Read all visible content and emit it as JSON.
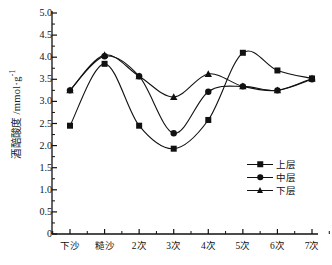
{
  "chart_data": {
    "type": "line",
    "title": "",
    "xlabel": "",
    "ylabel": "酒醅酸度 /mmol·g",
    "ylabel_exponent": "-1",
    "categories": [
      "下沙",
      "糙沙",
      "2次",
      "3次",
      "4次",
      "5次",
      "6次",
      "7次"
    ],
    "ylim": [
      0,
      5.0
    ],
    "ytick_labels": [
      "0",
      "0.5",
      "1.0",
      "1.5",
      "2.0",
      "2.5",
      "3.0",
      "3.5",
      "4.0",
      "4.5",
      "5.0"
    ],
    "ytick_values": [
      0,
      0.5,
      1.0,
      1.5,
      2.0,
      2.5,
      3.0,
      3.5,
      4.0,
      4.5,
      5.0
    ],
    "grid": false,
    "legend_position": "lower-right",
    "series": [
      {
        "name": "上层",
        "marker": "square",
        "color": "#111111",
        "values": [
          2.45,
          3.85,
          2.45,
          1.93,
          2.58,
          4.1,
          3.7,
          3.52
        ]
      },
      {
        "name": "中层",
        "marker": "circle",
        "color": "#111111",
        "values": [
          3.25,
          4.02,
          3.57,
          2.28,
          3.22,
          3.34,
          3.25,
          3.5
        ]
      },
      {
        "name": "下层",
        "marker": "triangle",
        "color": "#111111",
        "values": [
          3.25,
          4.05,
          3.57,
          3.1,
          3.62,
          3.34,
          3.25,
          3.52
        ]
      }
    ]
  },
  "legend": {
    "items": [
      {
        "label": "上层",
        "marker": "square"
      },
      {
        "label": "中层",
        "marker": "circle"
      },
      {
        "label": "下层",
        "marker": "triangle"
      }
    ]
  }
}
